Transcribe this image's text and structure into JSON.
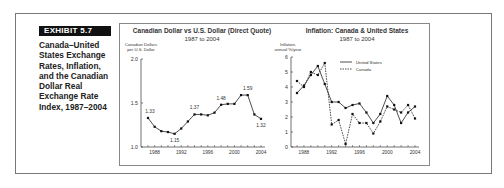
{
  "exhibit": {
    "label": "EXHIBIT 5.7",
    "caption_lines": [
      "Canada–United",
      "States Exchange",
      "Rates, Inflation,",
      "and the Canadian",
      "Dollar Real",
      "Exchange Rate",
      "Index, 1987–2004"
    ]
  },
  "colors": {
    "frame": "#777777",
    "exhibit_bg": "#111111",
    "line": "#222222"
  },
  "chart_data": [
    {
      "type": "line",
      "title": "Canadian Dollar vs U.S. Dollar (Direct Quote)",
      "subtitle": "1987 to 2004",
      "ylabel_lines": [
        "Canadian Dollars",
        "per U.S. Dollar"
      ],
      "xlabel": "",
      "ylim": [
        1.0,
        2.0
      ],
      "yticks": [
        "1.0",
        "1.5",
        "2.0"
      ],
      "xticks": [
        "1988",
        "1992",
        "1996",
        "2000",
        "2004"
      ],
      "x": [
        1987,
        1988,
        1989,
        1990,
        1991,
        1992,
        1993,
        1994,
        1995,
        1996,
        1997,
        1998,
        1999,
        2000,
        2001,
        2002,
        2003,
        2004
      ],
      "series": [
        {
          "name": "CAD per USD",
          "values": [
            1.33,
            1.23,
            1.18,
            1.17,
            1.15,
            1.21,
            1.29,
            1.37,
            1.37,
            1.36,
            1.39,
            1.48,
            1.49,
            1.49,
            1.59,
            1.59,
            1.37,
            1.32
          ]
        }
      ],
      "annotations": [
        {
          "x": 1987,
          "text": "1.33"
        },
        {
          "x": 1991,
          "text": "1.15"
        },
        {
          "x": 1994,
          "text": "1.37"
        },
        {
          "x": 1998,
          "text": "1.48"
        },
        {
          "x": 2002,
          "text": "1.59"
        },
        {
          "x": 2004,
          "text": "1.32"
        }
      ],
      "grid": false
    },
    {
      "type": "line",
      "title": "Inflation: Canada & United States",
      "subtitle": "1987 to 2004",
      "ylabel_lines": [
        "Inflation,",
        "annual %/year"
      ],
      "xlabel": "",
      "ylim": [
        0,
        6
      ],
      "yticks": [
        "0",
        "1",
        "2",
        "3",
        "4",
        "5",
        "6"
      ],
      "xticks": [
        "1988",
        "1992",
        "1996",
        "2000",
        "2004"
      ],
      "x": [
        1987,
        1988,
        1989,
        1990,
        1991,
        1992,
        1993,
        1994,
        1995,
        1996,
        1997,
        1998,
        1999,
        2000,
        2001,
        2002,
        2003,
        2004
      ],
      "series": [
        {
          "name": "United States",
          "style": "solid",
          "values": [
            3.6,
            4.1,
            4.8,
            5.4,
            4.2,
            3.0,
            3.0,
            2.6,
            2.8,
            2.9,
            2.3,
            1.6,
            2.2,
            3.4,
            2.8,
            1.6,
            2.3,
            2.7
          ]
        },
        {
          "name": "Canada",
          "style": "dashed",
          "values": [
            4.4,
            4.0,
            5.0,
            4.8,
            5.6,
            1.5,
            1.8,
            0.2,
            2.2,
            1.6,
            1.6,
            0.9,
            1.7,
            2.7,
            2.5,
            2.3,
            2.8,
            1.9
          ]
        }
      ],
      "legend": {
        "position": "upper-right",
        "entries": [
          "United States",
          "Canada"
        ]
      },
      "grid": false
    }
  ]
}
